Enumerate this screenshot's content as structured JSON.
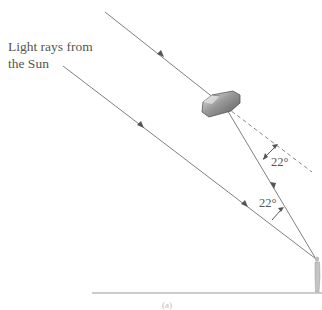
{
  "diagram": {
    "title_label_line1": "Light rays from",
    "title_label_line2": "the Sun",
    "angle_upper": "22°",
    "angle_lower": "22°",
    "caption": "(a)",
    "colors": {
      "ray": "#808080",
      "dashed": "#888888",
      "ground": "#999999",
      "crystal_dark": "#707070",
      "crystal_light": "#e8e8e8",
      "text": "#555555"
    },
    "elements": [
      "sun-ray-upper",
      "sun-ray-lower",
      "ice-crystal",
      "refracted-ray",
      "undeviated-extension-dashed",
      "angle-arc-upper",
      "angle-arc-lower",
      "observer",
      "ground-line"
    ]
  }
}
